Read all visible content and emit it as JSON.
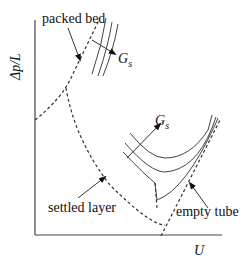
{
  "diagram": {
    "type": "fluidization-pressure-drop-diagram",
    "axes": {
      "ylabel": "Δp/L",
      "xlabel": "U"
    },
    "labels": {
      "packed_bed": "packed bed",
      "settled_layer": "settled layer",
      "empty_tube": "empty tube",
      "gs_upper": "G",
      "gs_upper_sub": "s",
      "gs_lower": "G",
      "gs_lower_sub": "s"
    },
    "colors": {
      "line": "#444444",
      "text": "#111111",
      "background": "#ffffff"
    }
  }
}
